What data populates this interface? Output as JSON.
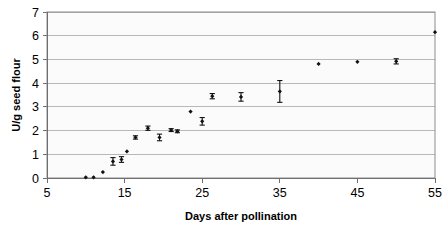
{
  "chart_data": {
    "type": "scatter",
    "title": "",
    "subtitle": "",
    "xlabel": "Days after pollination",
    "ylabel": "U/g seed flour",
    "xlim": [
      5,
      55
    ],
    "ylim": [
      0,
      7
    ],
    "xticks": [
      5,
      15,
      25,
      35,
      45,
      55
    ],
    "yticks": [
      0,
      1,
      2,
      3,
      4,
      5,
      6,
      7
    ],
    "xtick_labels": [
      "5",
      "15",
      "25",
      "35",
      "45",
      "55"
    ],
    "ytick_labels": [
      "0",
      "1",
      "2",
      "3",
      "4",
      "5",
      "6",
      "7"
    ],
    "grid": "horizontal",
    "legend": "none",
    "marker": "filled-diamond",
    "marker_color": "#111111",
    "error_bars": "vertical-symmetric",
    "x": [
      10,
      11,
      12.2,
      13.5,
      14.6,
      15.3,
      16.4,
      18,
      19.5,
      21,
      21.8,
      23.5,
      25,
      26.3,
      30,
      35,
      40,
      45,
      50,
      55
    ],
    "y": [
      0.03,
      0.03,
      0.25,
      0.7,
      0.78,
      1.12,
      1.71,
      2.1,
      1.71,
      2.02,
      1.97,
      2.8,
      2.39,
      3.45,
      3.42,
      3.65,
      4.81,
      4.9,
      4.92,
      6.15
    ],
    "yerr": [
      0,
      0,
      0,
      0.16,
      0.12,
      0,
      0.07,
      0.09,
      0.14,
      0.06,
      0.06,
      0,
      0.16,
      0.11,
      0.18,
      0.46,
      0,
      0,
      0.11,
      0
    ],
    "series": [
      {
        "name": "enzyme activity",
        "points": [
          {
            "x": 10,
            "y": 0.03,
            "yerr": 0
          },
          {
            "x": 11,
            "y": 0.03,
            "yerr": 0
          },
          {
            "x": 12.2,
            "y": 0.25,
            "yerr": 0
          },
          {
            "x": 13.5,
            "y": 0.7,
            "yerr": 0.16
          },
          {
            "x": 14.6,
            "y": 0.78,
            "yerr": 0.12
          },
          {
            "x": 15.3,
            "y": 1.12,
            "yerr": 0
          },
          {
            "x": 16.4,
            "y": 1.71,
            "yerr": 0.07
          },
          {
            "x": 18,
            "y": 2.1,
            "yerr": 0.09
          },
          {
            "x": 19.5,
            "y": 1.71,
            "yerr": 0.14
          },
          {
            "x": 21,
            "y": 2.02,
            "yerr": 0.06
          },
          {
            "x": 21.8,
            "y": 1.97,
            "yerr": 0.06
          },
          {
            "x": 23.5,
            "y": 2.8,
            "yerr": 0
          },
          {
            "x": 25,
            "y": 2.39,
            "yerr": 0.16
          },
          {
            "x": 26.3,
            "y": 3.45,
            "yerr": 0.11
          },
          {
            "x": 30,
            "y": 3.42,
            "yerr": 0.18
          },
          {
            "x": 35,
            "y": 3.65,
            "yerr": 0.46
          },
          {
            "x": 40,
            "y": 4.81,
            "yerr": 0
          },
          {
            "x": 45,
            "y": 4.9,
            "yerr": 0
          },
          {
            "x": 50,
            "y": 4.92,
            "yerr": 0.11
          },
          {
            "x": 55,
            "y": 6.15,
            "yerr": 0
          }
        ]
      }
    ]
  },
  "colors": {
    "marker": "#111111",
    "gridline": "#b0b0b0",
    "plot_background": "#fbfbfb",
    "page_background": "#ffffff",
    "axis": "#6f6f6f"
  }
}
